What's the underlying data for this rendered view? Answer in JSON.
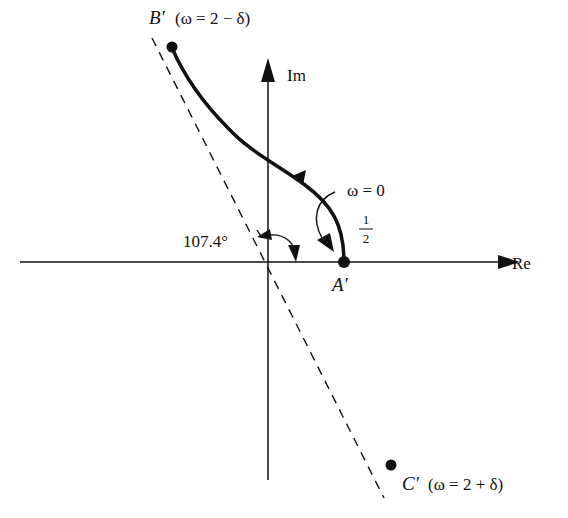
{
  "diagram": {
    "type": "nyquist-plot",
    "axes": {
      "real_label": "Re",
      "imag_label": "Im"
    },
    "points": {
      "A": {
        "name": "A′",
        "note": ""
      },
      "B": {
        "name": "B′",
        "condition": "(ω = 2 − δ)"
      },
      "C": {
        "name": "C′",
        "condition": "(ω = 2 + δ)"
      }
    },
    "annotations": {
      "omega_zero": "ω = 0",
      "half_numerator": "1",
      "half_denominator": "2",
      "angle": "107.4°"
    },
    "colors": {
      "line": "#111111",
      "background": "#ffffff"
    }
  }
}
